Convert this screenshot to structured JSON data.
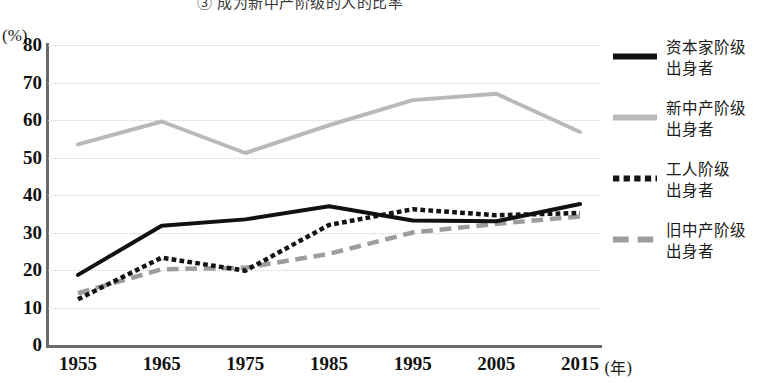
{
  "chart_data": {
    "type": "line",
    "title": "③ 成为新中产阶级的人的比率",
    "xlabel": "(年)",
    "ylabel": "(%)",
    "x": [
      1955,
      1965,
      1975,
      1985,
      1995,
      2005,
      2015
    ],
    "categories": [
      "1955",
      "1965",
      "1975",
      "1985",
      "1995",
      "2005",
      "2015"
    ],
    "ylim": [
      0,
      80
    ],
    "ytick_values": [
      0,
      10,
      20,
      30,
      40,
      50,
      60,
      70,
      80
    ],
    "ytick_labels": [
      "0",
      "10",
      "20",
      "30",
      "40",
      "50",
      "60",
      "70",
      "80"
    ],
    "grid": true,
    "grid_style": "dotted-horizontal",
    "legend_position": "right",
    "series": [
      {
        "name": "资本家阶级\n出身者",
        "style": "solid",
        "color": "#111111",
        "width": 4,
        "values": [
          18.7,
          31.8,
          33.5,
          37.0,
          33.2,
          33.0,
          37.6
        ]
      },
      {
        "name": "新中产阶级\n出身者",
        "style": "solid",
        "color": "#b9b9b9",
        "width": 4,
        "values": [
          53.5,
          59.6,
          51.2,
          58.6,
          65.3,
          67.0,
          56.8
        ]
      },
      {
        "name": "工人阶级\n出身者",
        "style": "dotted",
        "color": "#141414",
        "width": 4.5,
        "values": [
          12.2,
          23.3,
          19.8,
          32.0,
          36.2,
          34.6,
          35.2
        ]
      },
      {
        "name": "旧中产阶级\n出身者",
        "style": "dashed",
        "color": "#9d9d9d",
        "width": 4.5,
        "values": [
          13.8,
          20.2,
          20.6,
          24.3,
          30.0,
          32.3,
          34.3
        ]
      }
    ]
  },
  "legend": {
    "items": [
      {
        "label": "资本家阶级\n出身者",
        "swatch": "solid-black-line"
      },
      {
        "label": "新中产阶级\n出身者",
        "swatch": "solid-gray-line"
      },
      {
        "label": "工人阶级\n出身者",
        "swatch": "dotted-black-line"
      },
      {
        "label": "旧中产阶级\n出身者",
        "swatch": "dashed-gray-line"
      }
    ]
  }
}
